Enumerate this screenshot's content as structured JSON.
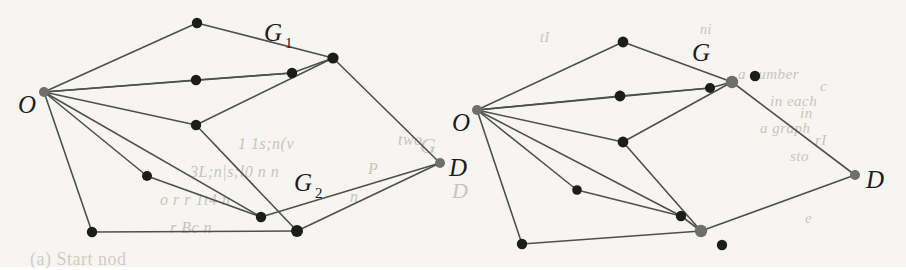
{
  "figure": {
    "caption_fragment": "(a) Start nod",
    "background_color": "#f6f5f2",
    "edge_color": "#4f4f4f",
    "node_color": "#1c1c1c",
    "terminal_node_color": "#6e6e6e",
    "panels": [
      {
        "name": "left-panel",
        "labels": {
          "origin": "O",
          "destination": "D",
          "graph_upper": "G",
          "graph_upper_sub": "1",
          "graph_lower": "G",
          "graph_lower_sub": "2"
        },
        "label_positions": {
          "origin": {
            "x": 18,
            "y": 113
          },
          "destination": {
            "x": 449,
            "y": 176
          },
          "graph_upper": {
            "x": 264,
            "y": 41
          },
          "graph_upper_sub": {
            "x": 285,
            "y": 48
          },
          "graph_lower": {
            "x": 294,
            "y": 191
          },
          "graph_lower_sub": {
            "x": 315,
            "y": 198
          }
        },
        "nodes": [
          {
            "id": "O",
            "x": 44,
            "y": 92,
            "r": 5.0,
            "kind": "terminal"
          },
          {
            "id": "t1",
            "x": 197,
            "y": 23,
            "r": 5.2,
            "kind": "normal"
          },
          {
            "id": "t2",
            "x": 333,
            "y": 58,
            "r": 5.6,
            "kind": "normal"
          },
          {
            "id": "m1",
            "x": 196,
            "y": 80,
            "r": 5.2,
            "kind": "normal"
          },
          {
            "id": "m2",
            "x": 292,
            "y": 73,
            "r": 5.2,
            "kind": "normal"
          },
          {
            "id": "m3",
            "x": 196,
            "y": 125,
            "r": 5.2,
            "kind": "normal"
          },
          {
            "id": "b1",
            "x": 147,
            "y": 176,
            "r": 5.0,
            "kind": "normal"
          },
          {
            "id": "b2",
            "x": 92,
            "y": 232,
            "r": 5.2,
            "kind": "normal"
          },
          {
            "id": "b3",
            "x": 261,
            "y": 217,
            "r": 5.2,
            "kind": "normal"
          },
          {
            "id": "b4",
            "x": 297,
            "y": 231,
            "r": 6.0,
            "kind": "normal"
          },
          {
            "id": "D",
            "x": 440,
            "y": 163,
            "r": 5.0,
            "kind": "terminal"
          }
        ],
        "edges": [
          [
            "O",
            "t1"
          ],
          [
            "t1",
            "t2"
          ],
          [
            "O",
            "m2"
          ],
          [
            "m2",
            "t2"
          ],
          [
            "O",
            "m1"
          ],
          [
            "m1",
            "m2"
          ],
          [
            "O",
            "m3"
          ],
          [
            "m3",
            "t2"
          ],
          [
            "O",
            "b1"
          ],
          [
            "b1",
            "b3"
          ],
          [
            "O",
            "b2"
          ],
          [
            "b2",
            "b4"
          ],
          [
            "O",
            "b3"
          ],
          [
            "b3",
            "D"
          ],
          [
            "m3",
            "b4"
          ],
          [
            "t2",
            "D"
          ],
          [
            "b4",
            "D"
          ]
        ]
      },
      {
        "name": "right-panel",
        "labels": {
          "origin": "O",
          "destination": "D",
          "graph": "G"
        },
        "label_positions": {
          "origin": {
            "x": 452,
            "y": 131
          },
          "destination": {
            "x": 866,
            "y": 188
          },
          "graph": {
            "x": 692,
            "y": 61
          }
        },
        "nodes": [
          {
            "id": "O",
            "x": 477,
            "y": 110,
            "r": 5.0,
            "kind": "terminal"
          },
          {
            "id": "t1",
            "x": 623,
            "y": 42,
            "r": 5.4,
            "kind": "normal"
          },
          {
            "id": "g",
            "x": 732,
            "y": 82,
            "r": 6.2,
            "kind": "terminal"
          },
          {
            "id": "m1",
            "x": 620,
            "y": 96,
            "r": 5.4,
            "kind": "normal"
          },
          {
            "id": "m2",
            "x": 710,
            "y": 88,
            "r": 5.0,
            "kind": "normal"
          },
          {
            "id": "m3",
            "x": 623,
            "y": 142,
            "r": 5.4,
            "kind": "normal"
          },
          {
            "id": "b1",
            "x": 577,
            "y": 190,
            "r": 4.8,
            "kind": "normal"
          },
          {
            "id": "b2",
            "x": 522,
            "y": 244,
            "r": 5.2,
            "kind": "normal"
          },
          {
            "id": "b3",
            "x": 681,
            "y": 216,
            "r": 5.2,
            "kind": "normal"
          },
          {
            "id": "b4",
            "x": 701,
            "y": 231,
            "r": 6.2,
            "kind": "terminal"
          },
          {
            "id": "D",
            "x": 855,
            "y": 175,
            "r": 5.0,
            "kind": "terminal"
          }
        ],
        "isolated_nodes": [
          {
            "id": "i1",
            "x": 755,
            "y": 76,
            "r": 5.2
          },
          {
            "id": "i2",
            "x": 722,
            "y": 245,
            "r": 5.2
          }
        ],
        "edges": [
          [
            "O",
            "t1"
          ],
          [
            "t1",
            "g"
          ],
          [
            "O",
            "m2"
          ],
          [
            "m2",
            "g"
          ],
          [
            "O",
            "m1"
          ],
          [
            "m1",
            "m2"
          ],
          [
            "O",
            "m3"
          ],
          [
            "m3",
            "g"
          ],
          [
            "O",
            "b1"
          ],
          [
            "b1",
            "b3"
          ],
          [
            "O",
            "b2"
          ],
          [
            "b2",
            "b4"
          ],
          [
            "O",
            "b3"
          ],
          [
            "b3",
            "b4"
          ],
          [
            "m3",
            "b4"
          ],
          [
            "g",
            "D"
          ],
          [
            "b4",
            "D"
          ]
        ]
      }
    ],
    "bleed_through_text": [
      {
        "text": "a number",
        "x": 738,
        "y": 66,
        "size": 15
      },
      {
        "text": "in each",
        "x": 770,
        "y": 93,
        "size": 15
      },
      {
        "text": "a graph",
        "x": 760,
        "y": 120,
        "size": 15
      },
      {
        "text": "sto",
        "x": 790,
        "y": 148,
        "size": 15
      },
      {
        "text": "1 1s;n(v",
        "x": 238,
        "y": 135,
        "size": 16
      },
      {
        "text": "two",
        "x": 398,
        "y": 131,
        "size": 16
      },
      {
        "text": "3L;n|s;l0 n n",
        "x": 190,
        "y": 163,
        "size": 16
      },
      {
        "text": "P",
        "x": 368,
        "y": 160,
        "size": 16
      },
      {
        "text": "o r r 1t4 n",
        "x": 160,
        "y": 191,
        "size": 16
      },
      {
        "text": "n",
        "x": 350,
        "y": 188,
        "size": 16
      },
      {
        "text": "r Bc n",
        "x": 170,
        "y": 219,
        "size": 16
      },
      {
        "text": "G",
        "x": 420,
        "y": 133,
        "size": 22
      },
      {
        "text": "tI",
        "x": 540,
        "y": 30,
        "size": 14
      },
      {
        "text": "ni",
        "x": 700,
        "y": 22,
        "size": 14
      },
      {
        "text": "c",
        "x": 820,
        "y": 78,
        "size": 15
      },
      {
        "text": "in",
        "x": 800,
        "y": 105,
        "size": 15
      },
      {
        "text": "rI",
        "x": 815,
        "y": 132,
        "size": 15
      },
      {
        "text": "e",
        "x": 805,
        "y": 210,
        "size": 15
      },
      {
        "text": "D",
        "x": 452,
        "y": 178,
        "size": 22
      }
    ],
    "caption_position": {
      "x": 30,
      "y": 256
    }
  }
}
